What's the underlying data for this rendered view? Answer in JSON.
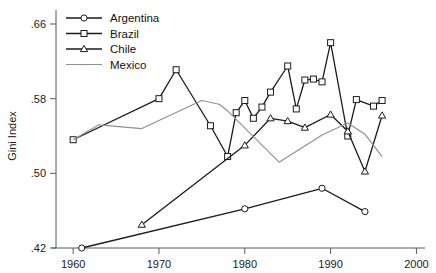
{
  "chart_data": {
    "type": "line",
    "title": "",
    "xlabel": "",
    "ylabel": "Gini Index",
    "xlim": [
      1958,
      2001
    ],
    "ylim": [
      0.42,
      0.675
    ],
    "xticks": [
      1960,
      1970,
      1980,
      1990,
      2000
    ],
    "xticklabels": [
      "1960",
      "1970",
      "1980",
      "1990",
      "2000"
    ],
    "yticks": [
      0.42,
      0.5,
      0.58,
      0.66
    ],
    "yticklabels": [
      ".42",
      ".50",
      ".58",
      ".66"
    ],
    "grid": false,
    "legend_position": "top-left",
    "series": [
      {
        "name": "Argentina",
        "marker": "circle",
        "color": "#1b1b1b",
        "x": [
          1961,
          1980,
          1989,
          1994
        ],
        "y": [
          0.42,
          0.462,
          0.484,
          0.459
        ]
      },
      {
        "name": "Brazil",
        "marker": "square",
        "color": "#1b1b1b",
        "x": [
          1960,
          1970,
          1972,
          1976,
          1978,
          1979,
          1980,
          1981,
          1982,
          1983,
          1985,
          1986,
          1987,
          1988,
          1989,
          1990,
          1992,
          1993,
          1995,
          1996
        ],
        "y": [
          0.536,
          0.58,
          0.611,
          0.551,
          0.518,
          0.565,
          0.578,
          0.559,
          0.571,
          0.587,
          0.615,
          0.569,
          0.6,
          0.601,
          0.598,
          0.64,
          0.54,
          0.579,
          0.572,
          0.578
        ]
      },
      {
        "name": "Chile",
        "marker": "triangle",
        "color": "#1b1b1b",
        "x": [
          1968,
          1980,
          1983,
          1985,
          1987,
          1990,
          1992,
          1994,
          1996
        ],
        "y": [
          0.445,
          0.53,
          0.559,
          0.556,
          0.549,
          0.563,
          0.545,
          0.502,
          0.562
        ]
      },
      {
        "name": "Mexico",
        "marker": "none",
        "color": "#8e9195",
        "x": [
          1960,
          1963,
          1968,
          1975,
          1977,
          1978,
          1984,
          1989,
          1992,
          1994,
          1996
        ],
        "y": [
          0.536,
          0.552,
          0.548,
          0.578,
          0.574,
          0.567,
          0.512,
          0.541,
          0.554,
          0.542,
          0.518
        ]
      }
    ]
  },
  "legend": {
    "items": [
      {
        "label": "Argentina",
        "marker": "circle"
      },
      {
        "label": "Brazil",
        "marker": "square"
      },
      {
        "label": "Chile",
        "marker": "triangle"
      },
      {
        "label": "Mexico",
        "marker": "line"
      }
    ]
  }
}
